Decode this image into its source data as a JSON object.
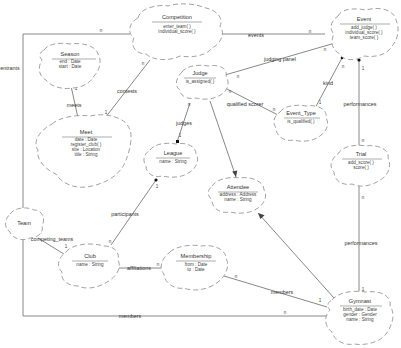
{
  "diagram": {
    "notation": "Booch class diagram (cloud notation)",
    "classes": {
      "competition": {
        "name": "Competition",
        "members": [
          "enter_team( )",
          "individual_score( )"
        ]
      },
      "event": {
        "name": "Event",
        "members": [
          "add_judge( )",
          "individual_score( )",
          "team_score( )"
        ]
      },
      "season": {
        "name": "Season",
        "members": [
          "end : Date",
          "start : Date"
        ]
      },
      "judge": {
        "name": "Judge",
        "members": [
          "is_assigned( )"
        ]
      },
      "event_type": {
        "name": "Event_Type",
        "members": [
          "is_qualified( )"
        ]
      },
      "meet": {
        "name": "Meet",
        "members": [
          "date : Date",
          "register_club( )",
          "site : Location",
          "title : String"
        ]
      },
      "league": {
        "name": "League",
        "members": [
          "name : String"
        ]
      },
      "trial": {
        "name": "Trial",
        "members": [
          "add_score( )",
          "score( )"
        ]
      },
      "attendee": {
        "name": "Attendee",
        "members": [
          "address : Address",
          "name : String"
        ]
      },
      "team": {
        "name": "Team",
        "members": []
      },
      "club": {
        "name": "Club",
        "members": [
          "name : String"
        ]
      },
      "membership": {
        "name": "Membership",
        "members": [
          "from : Date",
          "to : Date"
        ]
      },
      "gymnast": {
        "name": "Gymnast",
        "members": [
          "birth_date : Date",
          "gender : Gender",
          "name : String"
        ]
      }
    },
    "associations": {
      "entrants": {
        "label": "entrants",
        "from": "Competition",
        "to": "Team",
        "mult_from": "n",
        "mult_to": "n"
      },
      "events": {
        "label": "events",
        "from": "Competition",
        "to": "Event",
        "mult_from": "1",
        "mult_to": "n"
      },
      "contests": {
        "label": "contests",
        "from": "Competition",
        "to": "Meet",
        "mult_from": "n",
        "mult_to": "1"
      },
      "meets": {
        "label": "meets",
        "from": "Season",
        "to": "Meet",
        "mult_from": "1",
        "mult_to": "n"
      },
      "judging_panel": {
        "label": "judging panel",
        "from": "Judge",
        "to": "Event",
        "mult_from": "n",
        "mult_to": "n"
      },
      "kind": {
        "label": "kind",
        "from": "Event",
        "to": "Event_Type",
        "mult_from": "n",
        "mult_to": "1"
      },
      "qualified_scorer": {
        "label": "qualified scorer",
        "from": "Judge",
        "to": "Event_Type",
        "mult_from": "n",
        "mult_to": "n"
      },
      "judges": {
        "label": "judges",
        "from": "League",
        "to": "Judge",
        "mult_from": "1",
        "mult_to": "n"
      },
      "performances_event": {
        "label": "performances",
        "from": "Event",
        "to": "Trial",
        "mult_from": "1",
        "mult_to": "n"
      },
      "performances_gymnast": {
        "label": "performances",
        "from": "Gymnast",
        "to": "Trial",
        "mult_from": "1",
        "mult_to": "n"
      },
      "participants": {
        "label": "participants",
        "from": "League",
        "to": "Club",
        "mult_from": "1",
        "mult_to": "n"
      },
      "competing_teams": {
        "label": "competing_teams",
        "from": "Club",
        "to": "Team",
        "mult_from": "1",
        "mult_to": "n"
      },
      "affiliations": {
        "label": "affiliations",
        "from": "Club",
        "to": "Membership",
        "mult_from": "1",
        "mult_to": "n"
      },
      "members_membership": {
        "label": "members",
        "from": "Membership",
        "to": "Gymnast",
        "mult_from": "n",
        "mult_to": "1"
      },
      "members_team": {
        "label": "members",
        "from": "Team",
        "to": "Gymnast",
        "mult_from": "n",
        "mult_to": "n"
      }
    },
    "inheritance": [
      {
        "child": "Judge",
        "parent": "Attendee"
      },
      {
        "child": "Gymnast",
        "parent": "Attendee"
      }
    ]
  }
}
